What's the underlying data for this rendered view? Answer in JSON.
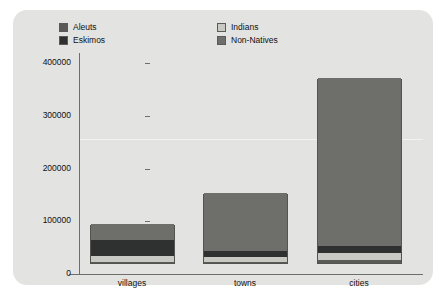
{
  "chart_data": {
    "type": "bar",
    "subtype": "stacked-bar",
    "title": "",
    "subtitle": "",
    "xlabel": "",
    "ylabel": "",
    "categories": [
      "villages",
      "towns",
      "cities"
    ],
    "ylim": [
      0,
      400000
    ],
    "yticks": [
      0,
      100000,
      200000,
      300000,
      400000
    ],
    "ytick_labels": [
      "0",
      "100000",
      "200000",
      "300000",
      "400000"
    ],
    "grid": false,
    "legend_position": "top",
    "stack_order_bottom_to_top": [
      "Aleuts",
      "Indians",
      "Eskimos",
      "Non-Natives"
    ],
    "series": [
      {
        "name": "Aleuts",
        "color": "#5a5b56",
        "values": [
          2500,
          2500,
          5000
        ]
      },
      {
        "name": "Indians",
        "color": "#c9c9c4",
        "values": [
          10000,
          9000,
          14000
        ]
      },
      {
        "name": "Eskimos",
        "color": "#2f3030",
        "values": [
          32000,
          12000,
          13000
        ]
      },
      {
        "name": "Non-Natives",
        "color": "#6e6f6a",
        "values": [
          29500,
          109500,
          319000
        ]
      }
    ],
    "totals": [
      74000,
      133000,
      351000
    ]
  },
  "legend": {
    "left_group": [
      {
        "label": "Aleuts",
        "color": "#5a5b56"
      },
      {
        "label": "Eskimos",
        "color": "#2f3030"
      }
    ],
    "right_group": [
      {
        "label": "Indians",
        "color": "#c9c9c4"
      },
      {
        "label": "Non-Natives",
        "color": "#6e6f6a"
      }
    ]
  },
  "colors": {
    "panel_background": "#e3e3e1",
    "page_background": "#ffffff",
    "axis": "#6e6e6e",
    "text": "#111111",
    "bar_outline": "#53544f",
    "gridline": "#f2f2f0"
  }
}
